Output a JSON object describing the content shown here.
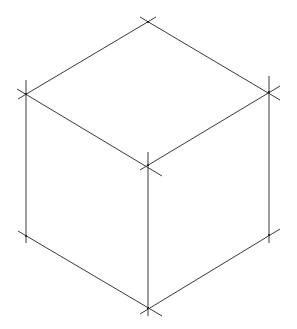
{
  "diagram": {
    "title": "",
    "stroke_color": "#3a3a3a",
    "background": "#ffffff",
    "vertices": {
      "top": [
        148,
        22
      ],
      "left_top": [
        26,
        94
      ],
      "right_top": [
        269,
        92
      ],
      "center": [
        148,
        165
      ],
      "left_bottom": [
        26,
        236
      ],
      "right_bottom": [
        269,
        235
      ],
      "bottom": [
        148,
        308
      ]
    },
    "edges": [
      {
        "name": "top-left-edge",
        "x1": 18,
        "y1": 99,
        "x2": 156,
        "y2": 17
      },
      {
        "name": "top-right-edge",
        "x1": 140,
        "y1": 17,
        "x2": 280,
        "y2": 100
      },
      {
        "name": "front-left-top-edge",
        "x1": 17,
        "y1": 89,
        "x2": 162,
        "y2": 176
      },
      {
        "name": "front-right-top-edge",
        "x1": 140,
        "y1": 170,
        "x2": 280,
        "y2": 86
      },
      {
        "name": "left-vertical-edge",
        "x1": 26,
        "y1": 80,
        "x2": 26,
        "y2": 243
      },
      {
        "name": "right-vertical-edge",
        "x1": 269,
        "y1": 76,
        "x2": 269,
        "y2": 243
      },
      {
        "name": "center-vertical-edge",
        "x1": 148,
        "y1": 152,
        "x2": 148,
        "y2": 316
      },
      {
        "name": "bottom-left-edge",
        "x1": 18,
        "y1": 231,
        "x2": 162,
        "y2": 316
      },
      {
        "name": "bottom-right-edge",
        "x1": 140,
        "y1": 314,
        "x2": 280,
        "y2": 229
      }
    ]
  }
}
